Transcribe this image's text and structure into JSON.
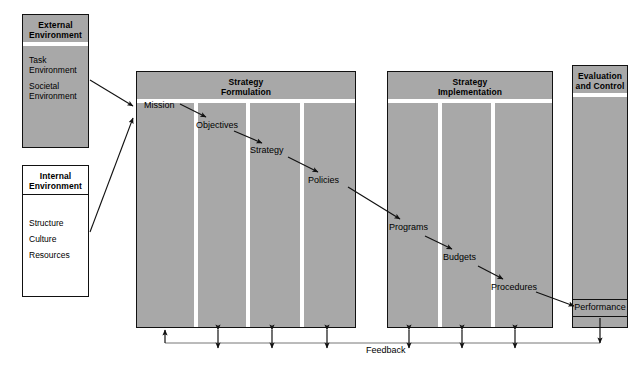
{
  "diagram": {
    "colors": {
      "block_fill": "#a8a8a8",
      "block_border": "#111111",
      "shadow": "#6b6b6b",
      "divider": "#ffffff",
      "line": "#111111",
      "page_background": "#ffffff"
    }
  },
  "external_environment": {
    "header": "External\nEnvironment",
    "header_line1": "External",
    "header_line2": "Environment",
    "items": [
      {
        "line1": "Task",
        "line2": "Environment"
      },
      {
        "line1": "Societal",
        "line2": "Environment"
      }
    ]
  },
  "internal_environment": {
    "header_line1": "Internal",
    "header_line2": "Environment",
    "items": [
      "Structure",
      "Culture",
      "Resources"
    ]
  },
  "strategy_formulation": {
    "header_line1": "Strategy",
    "header_line2": "Formulation",
    "steps": [
      "Mission",
      "Objectives",
      "Strategy",
      "Policies"
    ]
  },
  "strategy_implementation": {
    "header_line1": "Strategy",
    "header_line2": "Implementation",
    "steps": [
      "Programs",
      "Budgets",
      "Procedures"
    ]
  },
  "evaluation_and_control": {
    "header_line1": "Evaluation",
    "header_line2": "and Control",
    "steps": [
      "Performance"
    ]
  },
  "feedback": {
    "label": "Feedback"
  }
}
